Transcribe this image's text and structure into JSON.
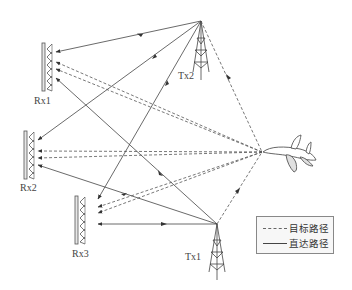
{
  "diagram": {
    "receivers": [
      {
        "id": "rx1",
        "label": "Rx1"
      },
      {
        "id": "rx2",
        "label": "Rx2"
      },
      {
        "id": "rx3",
        "label": "Rx3"
      }
    ],
    "transmitters": [
      {
        "id": "tx1",
        "label": "Tx1"
      },
      {
        "id": "tx2",
        "label": "Tx2"
      }
    ],
    "target": {
      "icon": "airplane-icon"
    },
    "legend": {
      "target_path": "目标路径",
      "direct_path": "直达路径"
    },
    "colors": {
      "line": "#444444",
      "antenna_fill": "#e6e6e6",
      "legend_border": "#888888"
    }
  }
}
